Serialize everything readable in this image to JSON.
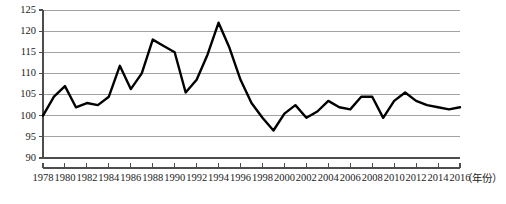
{
  "chart_data": {
    "type": "line",
    "title": "",
    "subtitle": "",
    "xlabel": "（年份）",
    "ylabel": "",
    "grid": true,
    "legend": null,
    "xlim": [
      1978,
      2016
    ],
    "ylim": [
      90,
      125
    ],
    "y_ticks": [
      90,
      95,
      100,
      105,
      110,
      115,
      120,
      125
    ],
    "x_ticks": [
      1978,
      1980,
      1982,
      1984,
      1986,
      1988,
      1990,
      1992,
      1994,
      1996,
      1998,
      2000,
      2002,
      2004,
      2006,
      2008,
      2010,
      2012,
      2014,
      2016
    ],
    "x_tick_labels": [
      "1978",
      "1980",
      "1982",
      "1984",
      "1986",
      "1988",
      "1990",
      "1992",
      "1994",
      "1996",
      "1998",
      "2000",
      "2002",
      "2004",
      "2006",
      "2008",
      "2010",
      "2012",
      "2014",
      "2016"
    ],
    "series": [
      {
        "name": "index",
        "color": "#000000",
        "x": [
          1978,
          1979,
          1980,
          1981,
          1982,
          1983,
          1984,
          1985,
          1986,
          1987,
          1988,
          1989,
          1990,
          1991,
          1992,
          1993,
          1994,
          1995,
          1996,
          1997,
          1998,
          1999,
          2000,
          2001,
          2002,
          2003,
          2004,
          2005,
          2006,
          2007,
          2008,
          2009,
          2010,
          2011,
          2012,
          2013,
          2014,
          2015,
          2016
        ],
        "values": [
          100.0,
          104.5,
          107.0,
          102.0,
          103.0,
          102.5,
          104.5,
          111.8,
          106.3,
          110.0,
          118.0,
          116.5,
          115.0,
          105.5,
          108.5,
          114.5,
          122.0,
          116.0,
          108.5,
          103.0,
          99.5,
          96.5,
          100.5,
          102.5,
          99.5,
          101.0,
          103.5,
          102.0,
          101.5,
          104.5,
          104.5,
          99.5,
          103.5,
          105.5,
          103.5,
          102.5,
          102.0,
          101.5,
          102.0
        ]
      }
    ],
    "axis_caption": "（年份）"
  },
  "colors": {
    "line": "#000000",
    "grid": "#8c8c8c",
    "axis": "#4d4d4d",
    "text": "#1a1a1a",
    "background": "#ffffff"
  }
}
